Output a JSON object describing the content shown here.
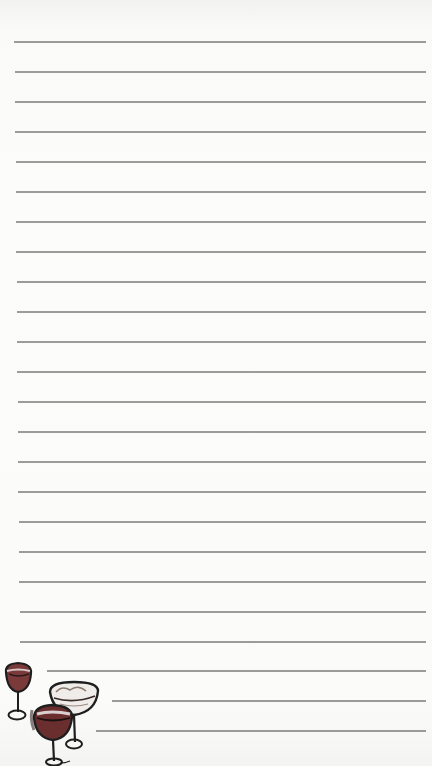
{
  "page": {
    "type": "lined-notepad",
    "background_color": "#fbfbfa",
    "line_color": "#8a8a8a",
    "line_spacing_px": 30
  },
  "lines": [
    {
      "y": 41,
      "x1": 14,
      "x2": 426
    },
    {
      "y": 71,
      "x1": 15,
      "x2": 426
    },
    {
      "y": 101,
      "x1": 15,
      "x2": 426
    },
    {
      "y": 131,
      "x1": 15,
      "x2": 426
    },
    {
      "y": 161,
      "x1": 16,
      "x2": 426
    },
    {
      "y": 191,
      "x1": 16,
      "x2": 426
    },
    {
      "y": 221,
      "x1": 16,
      "x2": 426
    },
    {
      "y": 251,
      "x1": 16,
      "x2": 426
    },
    {
      "y": 281,
      "x1": 17,
      "x2": 426
    },
    {
      "y": 311,
      "x1": 17,
      "x2": 426
    },
    {
      "y": 341,
      "x1": 17,
      "x2": 426
    },
    {
      "y": 371,
      "x1": 17,
      "x2": 426
    },
    {
      "y": 401,
      "x1": 18,
      "x2": 426
    },
    {
      "y": 431,
      "x1": 18,
      "x2": 426
    },
    {
      "y": 461,
      "x1": 18,
      "x2": 426
    },
    {
      "y": 491,
      "x1": 18,
      "x2": 426
    },
    {
      "y": 521,
      "x1": 19,
      "x2": 426
    },
    {
      "y": 551,
      "x1": 19,
      "x2": 426
    },
    {
      "y": 581,
      "x1": 19,
      "x2": 426
    },
    {
      "y": 611,
      "x1": 20,
      "x2": 426
    },
    {
      "y": 641,
      "x1": 20,
      "x2": 426
    },
    {
      "y": 670,
      "x1": 47,
      "x2": 426
    },
    {
      "y": 700,
      "x1": 112,
      "x2": 426
    },
    {
      "y": 730,
      "x1": 96,
      "x2": 426
    }
  ],
  "decoration": {
    "illustration": "wine-glasses-sketch",
    "count": 3
  }
}
